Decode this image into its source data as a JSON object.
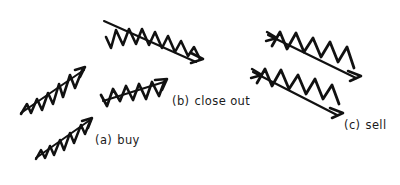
{
  "figure": {
    "background_color": "#ffffff",
    "stroke_color": "#111111",
    "width": 400,
    "height": 185
  },
  "labels": {
    "buy": {
      "tag": "(a)",
      "text": "buy"
    },
    "close_out": {
      "tag": "(b)",
      "text": "close out"
    },
    "sell": {
      "tag": "(c)",
      "text": "sell"
    }
  },
  "arrows": [
    {
      "id": "arrow-buy-upper",
      "group": "buy",
      "direction": "up-right",
      "description": "small rising zigzag arrow, upper of the buy pair"
    },
    {
      "id": "arrow-buy-lower",
      "group": "buy",
      "direction": "up-right",
      "description": "small rising zigzag arrow, lower of the buy pair"
    },
    {
      "id": "arrow-closeout-upper",
      "group": "close_out",
      "direction": "down-right",
      "description": "long falling zigzag arrow at top of the figure"
    },
    {
      "id": "arrow-closeout-lower",
      "group": "close_out",
      "direction": "up-right",
      "description": "rising zigzag arrow left of the close out label"
    },
    {
      "id": "arrow-sell-upper",
      "group": "sell",
      "direction": "down-right",
      "description": "falling zigzag arrow, upper of the sell pair"
    },
    {
      "id": "arrow-sell-lower",
      "group": "sell",
      "direction": "down-right",
      "description": "falling zigzag arrow, lower of the sell pair"
    }
  ]
}
